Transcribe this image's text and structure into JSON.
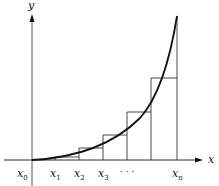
{
  "diagram": {
    "type": "riemann-lower-sum",
    "axes": {
      "x_label": "x",
      "y_label": "y"
    },
    "ticks": [
      {
        "base": "x",
        "sub": "0",
        "px": 32
      },
      {
        "base": "x",
        "sub": "1",
        "px": 55
      },
      {
        "base": "x",
        "sub": "2",
        "px": 79
      },
      {
        "base": "x",
        "sub": "3",
        "px": 103
      },
      {
        "base": "",
        "sub": "",
        "text": "· · ·",
        "px": 127
      },
      {
        "base": "x",
        "sub": "n",
        "px": 177
      }
    ],
    "curve": "increasing convex function from origin",
    "rectangles_count": 6,
    "colors": {
      "ink": "#111111",
      "background": "#ffffff"
    }
  }
}
